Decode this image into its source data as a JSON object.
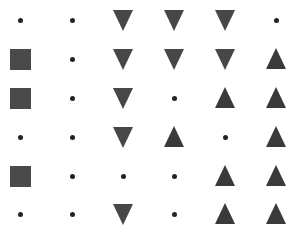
{
  "grid": {
    "rows": 6,
    "cols": 6,
    "col_x": [
      20,
      72,
      123,
      174,
      225,
      276
    ],
    "row_y": [
      20,
      59,
      98,
      137,
      176,
      214
    ],
    "cells": [
      [
        "dot",
        "dot",
        "triangle-down",
        "triangle-down",
        "triangle-down",
        "dot"
      ],
      [
        "square",
        "dot",
        "triangle-down",
        "triangle-down",
        "triangle-down",
        "triangle-up"
      ],
      [
        "square",
        "dot",
        "triangle-down",
        "dot",
        "triangle-up",
        "triangle-up"
      ],
      [
        "dot",
        "dot",
        "triangle-down",
        "triangle-up",
        "dot",
        "triangle-up"
      ],
      [
        "square",
        "dot",
        "dot",
        "dot",
        "triangle-up",
        "triangle-up"
      ],
      [
        "dot",
        "dot",
        "triangle-down",
        "dot",
        "triangle-up",
        "triangle-up"
      ]
    ]
  },
  "colors": {
    "background": "#ffffff",
    "dot": "#222222",
    "square": "#4a4a4a",
    "triangle_down": "#474747",
    "triangle_up": "#3a3a3a"
  }
}
